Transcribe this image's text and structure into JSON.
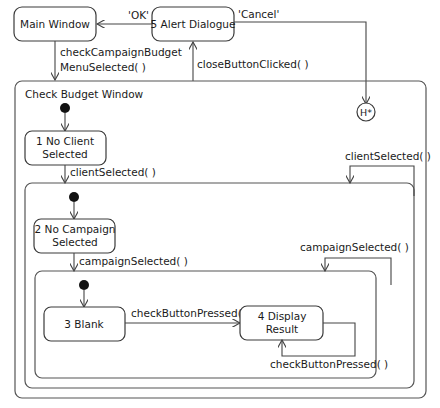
{
  "diagram": {
    "type": "UML state machine",
    "states": {
      "main_window": "Main Window",
      "alert_dialogue": "5 Alert Dialogue",
      "check_budget_window": "Check Budget Window",
      "no_client_line1": "1 No Client",
      "no_client_line2": "Selected",
      "no_campaign_line1": "2 No Campaign",
      "no_campaign_line2": "Selected",
      "blank": "3 Blank",
      "display_line1": "4 Display",
      "display_line2": "Result",
      "history": "H*"
    },
    "transitions": {
      "ok": "'OK'",
      "cancel": "'Cancel'",
      "check_campaign_line1": "checkCampaignBudget",
      "check_campaign_line2": "MenuSelected( )",
      "close_button": "closeButtonClicked( )",
      "client_selected_down": "clientSelected( )",
      "client_selected_self": "clientSelected( )",
      "campaign_selected_down": "campaignSelected( )",
      "campaign_selected_self": "campaignSelected( )",
      "check_button": "checkButtonPressed( )",
      "check_button_self": "checkButtonPressed( )"
    }
  }
}
